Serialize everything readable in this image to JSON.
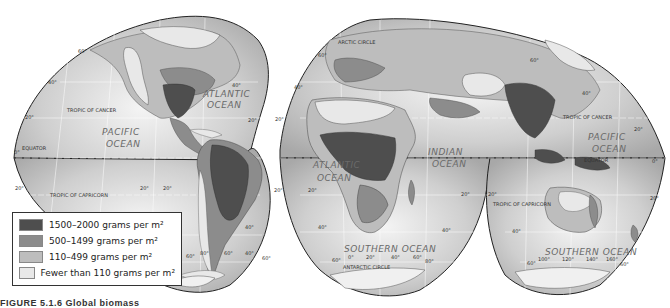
{
  "map": {
    "projection": "interrupted-goode-homolosine",
    "colors": {
      "ocean_light": "#f2f2f2",
      "ocean_dark": "#b4b4b4",
      "land_lowest": "#e8e8e8",
      "land_low": "#bdbdbd",
      "land_mid": "#8c8c8c",
      "land_high": "#4e4e4e",
      "outline": "#222222",
      "graticule": "#ffffff"
    },
    "oceans": {
      "atlantic_north_1": "ATLANTIC",
      "atlantic_north_2": "OCEAN",
      "pacific_west_1": "PACIFIC",
      "pacific_west_2": "OCEAN",
      "atlantic_south_1": "ATLANTIC",
      "atlantic_south_2": "OCEAN",
      "indian_1": "INDIAN",
      "indian_2": "OCEAN",
      "pacific_east_1": "PACIFIC",
      "pacific_east_2": "OCEAN",
      "southern_africa": "SOUTHERN OCEAN",
      "southern_australia": "SOUTHERN OCEAN"
    },
    "lines": {
      "tropic_cancer": "TROPIC OF CANCER",
      "tropic_capricorn": "TROPIC OF CAPRICORN",
      "equator": "EQUATOR",
      "arctic_circle": "ARCTIC CIRCLE",
      "antarctic_circle": "ANTARCTIC CIRCLE"
    },
    "degrees": {
      "d0": "0°",
      "d20": "20°",
      "d40": "40°",
      "d60": "60°",
      "d80": "80°",
      "d100": "100°",
      "d120": "120°",
      "d140": "140°",
      "d160": "160°"
    }
  },
  "legend": {
    "items": [
      {
        "label": "1500–2000 grams per m²",
        "color": "#4e4e4e"
      },
      {
        "label": "500–1499 grams per m²",
        "color": "#8c8c8c"
      },
      {
        "label": "110–499 grams per m²",
        "color": "#bdbdbd"
      },
      {
        "label": "Fewer than 110 grams per m²",
        "color": "#e8e8e8"
      }
    ]
  },
  "caption": {
    "text": "FIGURE 5.1.6     Global biomass"
  }
}
